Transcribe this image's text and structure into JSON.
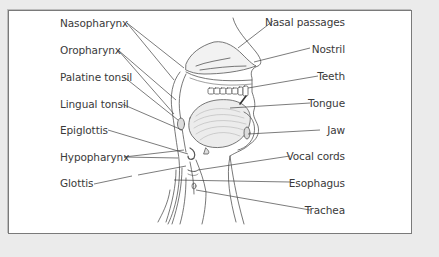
{
  "diagram": {
    "left_labels": [
      {
        "id": "nasopharynx",
        "text": "Nasopharynx"
      },
      {
        "id": "oropharynx",
        "text": "Oropharynx"
      },
      {
        "id": "palatine-tonsil",
        "text": "Palatine tonsil"
      },
      {
        "id": "lingual-tonsil",
        "text": "Lingual tonsil"
      },
      {
        "id": "epiglottis",
        "text": "Epiglottis"
      },
      {
        "id": "hypopharynx",
        "text": "Hypopharynx"
      },
      {
        "id": "glottis",
        "text": "Glottis"
      }
    ],
    "right_labels": [
      {
        "id": "nasal-passages",
        "text": "Nasal passages"
      },
      {
        "id": "nostril",
        "text": "Nostril"
      },
      {
        "id": "teeth",
        "text": "Teeth"
      },
      {
        "id": "tongue",
        "text": "Tongue"
      },
      {
        "id": "jaw",
        "text": "Jaw"
      },
      {
        "id": "vocal-cords",
        "text": "Vocal cords"
      },
      {
        "id": "esophagus",
        "text": "Esophagus"
      },
      {
        "id": "trachea",
        "text": "Trachea"
      }
    ],
    "colors": {
      "background": "#ebebeb",
      "panel": "#ffffff",
      "border": "#7a7a7a",
      "ink": "#3a3a3a",
      "shade": "#d9d9d9"
    }
  }
}
